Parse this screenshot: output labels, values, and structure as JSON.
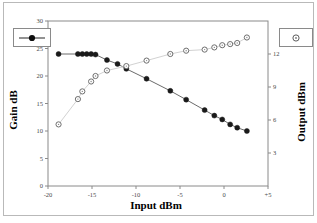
{
  "figure": {
    "background": "#ffffff",
    "border_color": "#b9b9b9",
    "frame_color": "#8a8a8a"
  },
  "axis_titles": {
    "left": "Gain dB",
    "right": "Output dBm",
    "bottom": "Input dBm"
  },
  "legend": {
    "left_marker": "filled-circle-with-line",
    "right_marker": "open-circle"
  },
  "chart_data": {
    "type": "line",
    "title": "",
    "xlabel": "Input dBm",
    "ylabel": "Gain dB",
    "y2label": "Output dBm",
    "xlim": [
      -20,
      5
    ],
    "xticks": [
      -20,
      -15,
      -10,
      -5,
      0,
      5
    ],
    "xticklabels": [
      "-20",
      "-15",
      "-10",
      "-5",
      "0",
      "+5"
    ],
    "ylim": [
      0,
      30
    ],
    "yticks": [
      0,
      5,
      10,
      15,
      20,
      25,
      30
    ],
    "yticklabels": [
      "0",
      "5",
      "10",
      "15",
      "20",
      "25",
      "30"
    ],
    "y2lim": [
      0,
      15
    ],
    "y2ticks": [
      3,
      6,
      9,
      12
    ],
    "y2ticklabels": [
      "3",
      "6",
      "9",
      "12"
    ],
    "grid": false,
    "legend_position": "outside-top-left-and-top-right",
    "series": [
      {
        "name": "Gain dB",
        "marker": "filled-circle",
        "axis": "left",
        "color": "#1a1a1a",
        "line_color": "#6b6b6b",
        "x": [
          -18.8,
          -16.6,
          -16.1,
          -15.6,
          -15.1,
          -14.6,
          -13.3,
          -12.1,
          -11.1,
          -8.8,
          -6.1,
          -4.3,
          -2.2,
          -1.1,
          -0.2,
          0.7,
          1.5,
          2.6
        ],
        "y": [
          24.0,
          24.0,
          24.0,
          24.0,
          24.0,
          23.9,
          22.9,
          22.2,
          21.3,
          19.5,
          17.3,
          15.7,
          13.8,
          12.8,
          12.1,
          11.2,
          10.6,
          10.0
        ]
      },
      {
        "name": "Output dBm",
        "marker": "open-circle",
        "axis": "right",
        "color": "#6e6e6e",
        "line_color": "#d2d2d2",
        "x": [
          -18.8,
          -16.6,
          -16.1,
          -15.1,
          -14.6,
          -13.3,
          -11.1,
          -8.8,
          -6.1,
          -4.3,
          -2.2,
          -1.1,
          -0.2,
          0.7,
          1.5,
          2.6
        ],
        "y": [
          5.6,
          7.9,
          8.6,
          9.5,
          10.0,
          10.5,
          10.9,
          11.4,
          12.0,
          12.3,
          12.4,
          12.6,
          12.8,
          12.9,
          13.0,
          13.5
        ]
      }
    ]
  }
}
